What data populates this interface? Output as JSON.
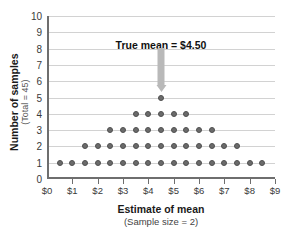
{
  "chart_data": {
    "type": "scatter",
    "plot_style": "dotplot",
    "title": "",
    "xlabel": "Estimate of mean",
    "xlabel_sub": "(Sample size = 2)",
    "ylabel": "Number of samples",
    "ylabel_sub": "(Total = 45)",
    "xlim": [
      0,
      9
    ],
    "ylim": [
      0,
      10
    ],
    "grid": "horizontal",
    "legend": "none",
    "xtick_values": [
      0,
      1,
      2,
      3,
      4,
      5,
      6,
      7,
      8,
      9
    ],
    "xtick_labels": [
      "$0",
      "$1",
      "$2",
      "$3",
      "$4",
      "$5",
      "$6",
      "$7",
      "$8",
      "$9"
    ],
    "ytick_values": [
      0,
      1,
      2,
      3,
      4,
      5,
      6,
      7,
      8,
      9,
      10
    ],
    "ytick_labels": [
      "0",
      "1",
      "2",
      "3",
      "4",
      "5",
      "6",
      "7",
      "8",
      "9",
      "10"
    ],
    "x": [
      0.5,
      1.0,
      1.5,
      2.0,
      2.5,
      3.0,
      3.5,
      4.0,
      4.5,
      5.0,
      5.5,
      6.0,
      6.5,
      7.0,
      7.5,
      8.0,
      8.5
    ],
    "counts": [
      1,
      1,
      2,
      2,
      3,
      3,
      4,
      4,
      5,
      4,
      4,
      3,
      3,
      2,
      2,
      1,
      1
    ],
    "stacks": [
      {
        "y": 1,
        "x": [
          0.5,
          1.0,
          1.5,
          2.0,
          2.5,
          3.0,
          3.5,
          4.0,
          4.5,
          5.0,
          5.5,
          6.0,
          6.5,
          7.0,
          7.5,
          8.0,
          8.5
        ]
      },
      {
        "y": 2,
        "x": [
          1.5,
          2.0,
          2.5,
          3.0,
          3.5,
          4.0,
          4.5,
          5.0,
          5.5,
          6.0,
          6.5,
          7.0,
          7.5
        ]
      },
      {
        "y": 3,
        "x": [
          2.5,
          3.0,
          3.5,
          4.0,
          4.5,
          5.0,
          5.5,
          6.0,
          6.5
        ]
      },
      {
        "y": 4,
        "x": [
          3.5,
          4.0,
          4.5,
          5.0,
          5.5
        ]
      },
      {
        "y": 5,
        "x": [
          4.5
        ]
      }
    ],
    "total_samples": 45,
    "annotations": [
      {
        "text": "True mean  =  $4.50",
        "x": 4.5,
        "value": 4.5,
        "arrow": "down",
        "arrow_color": "#b9b9b9"
      }
    ]
  },
  "colors": {
    "dot_fill": "#6b6b6b",
    "dot_edge": "#4f4f4f",
    "gridline": "#d2d2d2",
    "axis": "#6e6e6e",
    "arrow": "#b9b9b9",
    "background": "#ffffff"
  }
}
